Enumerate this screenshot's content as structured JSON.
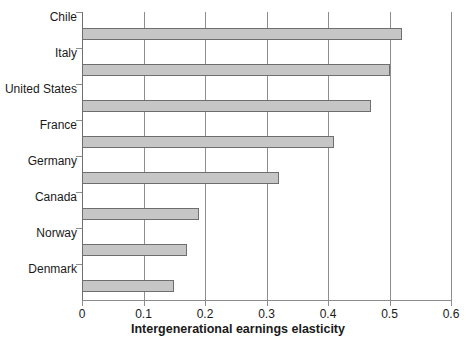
{
  "chart_data": {
    "type": "bar",
    "orientation": "horizontal",
    "title": "",
    "xlabel": "Intergenerational earnings elasticity",
    "ylabel": "",
    "xlim": [
      0,
      0.6
    ],
    "xticks": [
      "0",
      "0.1",
      "0.2",
      "0.3",
      "0.4",
      "0.5",
      "0.6"
    ],
    "xtick_values": [
      0,
      0.1,
      0.2,
      0.3,
      0.4,
      0.5,
      0.6
    ],
    "grid": "vertical",
    "legend": "none",
    "categories": [
      "Chile",
      "Italy",
      "United States",
      "France",
      "Germany",
      "Canada",
      "Norway",
      "Denmark"
    ],
    "values": [
      0.52,
      0.5,
      0.47,
      0.41,
      0.32,
      0.19,
      0.17,
      0.15
    ],
    "bar_color": "#c6c6c6",
    "bar_edge_color": "#6e6e6e",
    "axis_color": "#8d8d8d",
    "background_color": "#ffffff"
  }
}
